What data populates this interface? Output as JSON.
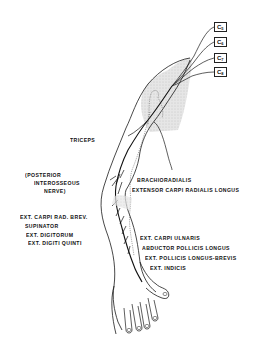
{
  "diagram": {
    "nerve_roots": [
      {
        "label": "C",
        "sub": "5"
      },
      {
        "label": "C",
        "sub": "6"
      },
      {
        "label": "C",
        "sub": "7"
      },
      {
        "label": "C",
        "sub": "8"
      }
    ],
    "labels": {
      "triceps": "TRICEPS",
      "posterior_1": "(POSTERIOR",
      "posterior_2": "INTEROSSEOUS",
      "posterior_3": "NERVE)",
      "brachioradialis": "BRACHIORADIALIS",
      "ecrl": "EXTENSOR CARPI RADIALIS LONGUS",
      "ecrb": "EXT. CARPI RAD. BREV.",
      "supinator": "SUPINATOR",
      "ext_digitorum": "EXT. DIGITORUM",
      "ext_digiti_quinti": "EXT. DIGITI QUINTI",
      "ecu": "EXT. CARPI ULNARIS",
      "apl": "ABDUCTOR POLLICIS LONGUS",
      "epl_epb": "EXT. POLLICIS LONGUS-BREVIS",
      "ext_indicis": "EXT. INDICIS"
    },
    "colors": {
      "line": "#1a1a1a",
      "shade": "#d9d9d9",
      "background": "#ffffff"
    }
  }
}
